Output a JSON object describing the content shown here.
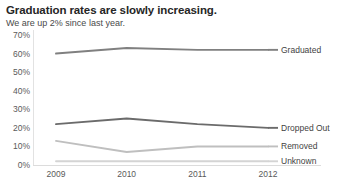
{
  "chart_data": {
    "type": "line",
    "title": "Graduation rates are slowly increasing.",
    "subtitle": "We are up 2% since last year.",
    "xlabel": "",
    "ylabel": "",
    "categories": [
      "2009",
      "2010",
      "2011",
      "2012"
    ],
    "ylim": [
      0,
      70
    ],
    "yticks": [
      "0%",
      "10%",
      "20%",
      "30%",
      "40%",
      "50%",
      "60%",
      "70%"
    ],
    "ytick_values": [
      0,
      10,
      20,
      30,
      40,
      50,
      60,
      70
    ],
    "grid": false,
    "legend_position": "right-inline-end-of-line",
    "series": [
      {
        "name": "Graduated",
        "values": [
          60,
          63,
          62,
          62
        ],
        "color": "#808080"
      },
      {
        "name": "Dropped Out",
        "values": [
          22,
          25,
          22,
          20
        ],
        "color": "#6b6b6b"
      },
      {
        "name": "Removed",
        "values": [
          13,
          7,
          10,
          10
        ],
        "color": "#bfbfbf"
      },
      {
        "name": "Unknown",
        "values": [
          2,
          2,
          2,
          2
        ],
        "color": "#d4d4d4"
      }
    ]
  },
  "colors": {
    "title": "#262626",
    "subtitle": "#4a4a4a",
    "axis_text": "#5a5a5a",
    "axis_line": "#e2e2e2",
    "background": "#ffffff"
  }
}
